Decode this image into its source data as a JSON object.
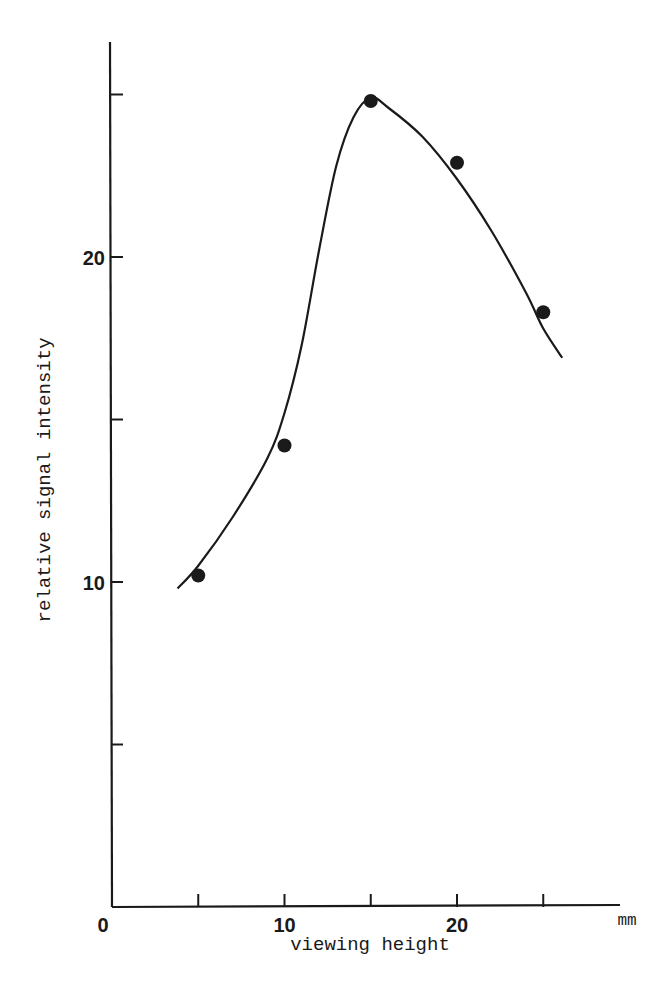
{
  "chart_data": {
    "type": "scatter",
    "title": "",
    "xlabel": "viewing height",
    "x_unit": "mm",
    "ylabel": "relative signal intensity",
    "xlim": [
      0,
      30
    ],
    "ylim": [
      0,
      26
    ],
    "x_ticks": [
      5,
      10,
      15,
      20,
      25
    ],
    "x_tick_labels": [
      "0",
      "10",
      "20"
    ],
    "x_tick_label_values": [
      0,
      10,
      20
    ],
    "y_ticks": [
      5,
      10,
      15,
      20,
      25
    ],
    "y_tick_labels": [
      "10",
      "20"
    ],
    "y_tick_label_values": [
      10,
      20
    ],
    "grid": false,
    "legend": null,
    "series": [
      {
        "name": "measured",
        "marker": "filled-circle",
        "x": [
          5,
          10,
          15,
          20,
          25
        ],
        "y": [
          10.2,
          14.2,
          24.8,
          22.9,
          18.3
        ]
      },
      {
        "name": "fitted curve",
        "style": "smooth-line",
        "x": [
          3.8,
          5,
          7,
          9,
          10,
          11,
          12,
          13,
          14,
          15,
          16,
          18,
          20,
          22,
          24,
          25,
          26.1
        ],
        "y": [
          9.8,
          10.5,
          12.0,
          13.8,
          15.2,
          17.3,
          20.2,
          22.8,
          24.3,
          24.9,
          24.6,
          23.7,
          22.4,
          20.8,
          18.9,
          17.8,
          16.9
        ]
      }
    ],
    "colors": {
      "ink": "#1a1a1a",
      "background": "#ffffff"
    }
  }
}
